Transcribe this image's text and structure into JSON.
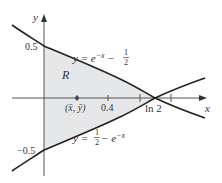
{
  "figure": {
    "axes": {
      "x_label": "x",
      "y_label": "y"
    },
    "curves": {
      "upper": {
        "label_prefix": "y = e",
        "label_exp": "−x",
        "label_suffix": " − ",
        "frac_num": "1",
        "frac_den": "2",
        "equation": "y = e^{-x} - 1/2"
      },
      "lower": {
        "label_prefix": "y = ",
        "frac_num": "1",
        "frac_den": "2",
        "label_mid": " − e",
        "label_exp": "−x",
        "equation": "y = 1/2 - e^{-x}"
      }
    },
    "region_label": "R",
    "centroid_label": "(x̄, ȳ)",
    "tick_labels": {
      "y_pos": "0.5",
      "y_neg": "−0.5",
      "x_04": "0.4",
      "x_ln2": "ln 2"
    },
    "colors": {
      "curve": "#222222",
      "axis": "#555555",
      "region_fill": "#e6e7e9",
      "text": "#333333"
    }
  }
}
